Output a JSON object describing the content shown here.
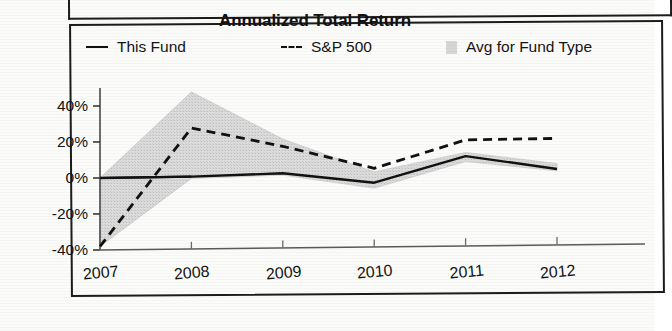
{
  "figure": {
    "title": "Annualized Total Return"
  },
  "legend": {
    "items": [
      {
        "label": "This Fund",
        "marker": "solid-line-swatch"
      },
      {
        "label": "S&P 500",
        "marker": "dashed-line-swatch"
      },
      {
        "label": "Avg for Fund Type",
        "marker": "gray-band-swatch"
      }
    ]
  },
  "axes": {
    "y_ticks": [
      "40%",
      "20%",
      "0%",
      "-20%",
      "-40%"
    ],
    "x_ticks": [
      "2007",
      "2008",
      "2009",
      "2010",
      "2011",
      "2012"
    ]
  },
  "colors": {
    "this_fund": "#111111",
    "sp500": "#111111",
    "avg_band": "#d6d6d6",
    "axis": "#555555",
    "frame": "#1c1c1c"
  },
  "chart_data": {
    "type": "line",
    "title": "Annualized Total Return",
    "xlabel": "",
    "ylabel": "",
    "x": [
      2007,
      2008,
      2009,
      2010,
      2011,
      2012
    ],
    "categories": [
      "2007",
      "2008",
      "2009",
      "2010",
      "2011",
      "2012"
    ],
    "ylim": [
      -40,
      50
    ],
    "yticks": [
      -40,
      -20,
      0,
      20,
      40
    ],
    "ytick_labels": [
      "-40%",
      "-20%",
      "0%",
      "20%",
      "40%"
    ],
    "grid": false,
    "legend_position": "top",
    "series": [
      {
        "name": "This Fund",
        "style": "solid",
        "values": [
          0,
          1,
          3,
          -2,
          13,
          6
        ]
      },
      {
        "name": "S&P 500",
        "style": "dashed",
        "values": [
          -38,
          28,
          18,
          6,
          22,
          23
        ]
      },
      {
        "name": "Avg for Fund Type",
        "style": "band",
        "band_upper": [
          0,
          48,
          22,
          4,
          15,
          9
        ],
        "band_lower": [
          -38,
          0,
          2,
          -5,
          10,
          5
        ]
      }
    ]
  }
}
